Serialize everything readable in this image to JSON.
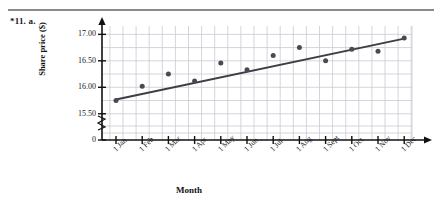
{
  "header": {
    "question_label": "*11. a."
  },
  "chart_data": {
    "type": "scatter",
    "title": "",
    "xlabel": "Month",
    "ylabel": "Share price ($)",
    "categories": [
      "1 Jan",
      "1 Feb",
      "1 Mar",
      "1 Apr",
      "1 May",
      "1 Jun",
      "1 Jul",
      "1 Aug",
      "1 Sept",
      "1 Oct",
      "1 Nov",
      "1 Dec"
    ],
    "values": [
      15.75,
      16.02,
      16.25,
      16.12,
      16.46,
      16.33,
      16.6,
      16.75,
      16.5,
      16.72,
      16.68,
      16.93
    ],
    "yticks": [
      "0",
      "15.50",
      "16.00",
      "16.50",
      "17.00"
    ],
    "ytick_values": [
      0,
      15.5,
      16.0,
      16.5,
      17.0
    ],
    "ylim": [
      15.4,
      17.12
    ],
    "grid": true,
    "axis_break": true,
    "legend": "none",
    "trend_line": {
      "label": "line of best fit",
      "start": {
        "x": "1 Jan",
        "y": 15.77
      },
      "end": {
        "x": "1 Dec",
        "y": 16.92
      }
    },
    "colors": {
      "point": "#4a4a52",
      "line": "#3d3d44",
      "grid": "#c9c9d4",
      "axis": "#111111"
    }
  }
}
